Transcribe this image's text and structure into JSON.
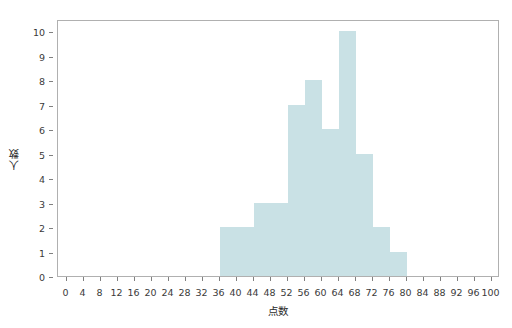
{
  "chart_data": {
    "type": "bar",
    "title": "",
    "subtitle": "",
    "xlabel": "点数",
    "ylabel": "人数",
    "grid": false,
    "legend": false,
    "legend_position": "none",
    "bar_color": "#c9e1e5",
    "axis_color": "#b0b0b0",
    "tick_color": "#808080",
    "text_color": "#3b3b3b",
    "background": "#ffffff",
    "bin_width": 4,
    "xlim": [
      -2,
      102
    ],
    "ylim": [
      0,
      10.5
    ],
    "x_ticks": [
      0,
      4,
      8,
      12,
      16,
      20,
      24,
      28,
      32,
      36,
      40,
      44,
      48,
      52,
      56,
      60,
      64,
      68,
      72,
      76,
      80,
      84,
      88,
      92,
      96,
      100
    ],
    "x_tick_labels": [
      "0",
      "4",
      "8",
      "12",
      "16",
      "20",
      "24",
      "28",
      "32",
      "36",
      "40",
      "44",
      "48",
      "52",
      "56",
      "60",
      "64",
      "68",
      "72",
      "76",
      "80",
      "84",
      "88",
      "92",
      "96",
      "100"
    ],
    "y_ticks": [
      0,
      1,
      2,
      3,
      4,
      5,
      6,
      7,
      8,
      9,
      10
    ],
    "y_tick_labels": [
      "0",
      "1",
      "2",
      "3",
      "4",
      "5",
      "6",
      "7",
      "8",
      "9",
      "10"
    ],
    "categories": [
      "36-40",
      "40-44",
      "44-48",
      "48-52",
      "52-56",
      "56-60",
      "60-64",
      "64-68",
      "68-72",
      "72-76",
      "76-80"
    ],
    "bins": [
      {
        "start": 36,
        "end": 40,
        "value": 2
      },
      {
        "start": 40,
        "end": 44,
        "value": 2
      },
      {
        "start": 44,
        "end": 48,
        "value": 3
      },
      {
        "start": 48,
        "end": 52,
        "value": 3
      },
      {
        "start": 52,
        "end": 56,
        "value": 7
      },
      {
        "start": 56,
        "end": 60,
        "value": 8
      },
      {
        "start": 60,
        "end": 64,
        "value": 6
      },
      {
        "start": 64,
        "end": 68,
        "value": 10
      },
      {
        "start": 68,
        "end": 72,
        "value": 5
      },
      {
        "start": 72,
        "end": 76,
        "value": 2
      },
      {
        "start": 76,
        "end": 80,
        "value": 1
      }
    ],
    "values": [
      2,
      2,
      3,
      3,
      7,
      8,
      6,
      10,
      5,
      2,
      1
    ]
  }
}
